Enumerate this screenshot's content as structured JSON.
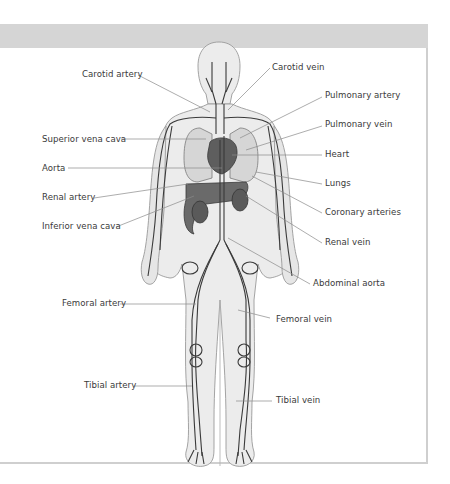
{
  "diagram": {
    "colors": {
      "header_band": "#d5d5d5",
      "frame_border": "#cfcfcf",
      "body_fill": "#ececec",
      "body_outline": "#9a9a9a",
      "vessel": "#3a3a3a",
      "organ_dark": "#5a5a5a",
      "organ_light": "#cfcfcf",
      "leader_line": "#8a8a8a",
      "label_text": "#3a3a3a"
    },
    "labels_left": [
      {
        "id": "carotid-artery",
        "text": "Carotid artery"
      },
      {
        "id": "superior-vena-cava",
        "text": "Superior vena cava"
      },
      {
        "id": "aorta",
        "text": "Aorta"
      },
      {
        "id": "renal-artery",
        "text": "Renal artery"
      },
      {
        "id": "inferior-vena-cava",
        "text": "Inferior vena cava"
      },
      {
        "id": "femoral-artery",
        "text": "Femoral artery"
      },
      {
        "id": "tibial-artery",
        "text": "Tibial artery"
      }
    ],
    "labels_right": [
      {
        "id": "carotid-vein",
        "text": "Carotid vein"
      },
      {
        "id": "pulmonary-artery",
        "text": "Pulmonary artery"
      },
      {
        "id": "pulmonary-vein",
        "text": "Pulmonary vein"
      },
      {
        "id": "heart",
        "text": "Heart"
      },
      {
        "id": "lungs",
        "text": "Lungs"
      },
      {
        "id": "coronary-arteries",
        "text": "Coronary arteries"
      },
      {
        "id": "renal-vein",
        "text": "Renal vein"
      },
      {
        "id": "abdominal-aorta",
        "text": "Abdominal aorta"
      },
      {
        "id": "femoral-vein",
        "text": "Femoral vein"
      },
      {
        "id": "tibial-vein",
        "text": "Tibial vein"
      }
    ]
  }
}
